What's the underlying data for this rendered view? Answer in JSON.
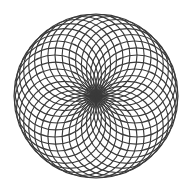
{
  "figure": {
    "type": "circle-rosette",
    "background": "#ffffff",
    "stroke_color": "#3a3a3a",
    "stroke_width": 1.15,
    "center": [
      96,
      96
    ],
    "outer_radius": 82,
    "circle_count": 36
  }
}
